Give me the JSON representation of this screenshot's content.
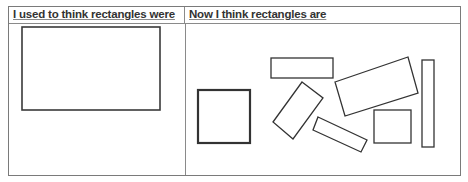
{
  "table": {
    "headers": [
      "I used to think rectangles were",
      "Now I think rectangles are"
    ]
  },
  "left_cell": {
    "shapes": [
      {
        "type": "rectangle",
        "description": "single upright landscape rectangle"
      }
    ]
  },
  "right_cell": {
    "shapes": [
      {
        "type": "square",
        "description": "upright square, thick outline"
      },
      {
        "type": "rectangle",
        "description": "horizontal thin rectangle, top"
      },
      {
        "type": "rectangle",
        "description": "rotated rectangle, tilted"
      },
      {
        "type": "rectangle",
        "description": "rotated long thin rectangle"
      },
      {
        "type": "rectangle",
        "description": "large tilted rectangle"
      },
      {
        "type": "rectangle",
        "description": "small upright near-square rectangle"
      },
      {
        "type": "rectangle",
        "description": "tall thin vertical rectangle"
      }
    ]
  }
}
